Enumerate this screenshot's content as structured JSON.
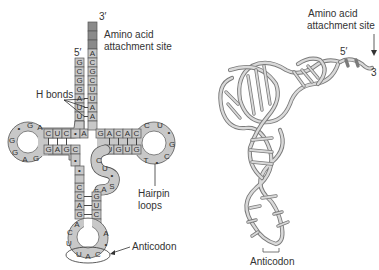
{
  "figure": {
    "left_panel": {
      "title": "tRNA cloverleaf (2D) structure",
      "labels": {
        "three_prime": "3′",
        "five_prime": "5′",
        "amino_acid_site_line1": "Amino acid",
        "amino_acid_site_line2": "attachment site",
        "h_bonds": "H bonds",
        "hairpin_line1": "Hairpin",
        "hairpin_line2": "loops",
        "anticodon": "Anticodon"
      },
      "acceptor_stem": {
        "unlabeled_3prime_cells": 3,
        "right_strand": [
          "A",
          "C",
          "G",
          "C",
          "U",
          "U",
          "A",
          "A"
        ],
        "left_strand": [
          "G",
          "C",
          "G",
          "G",
          "A",
          "U",
          "U"
        ]
      },
      "d_arm": {
        "top_strand": [
          "C",
          "U",
          "C",
          "A"
        ],
        "bottom_strand": [
          "G",
          "A",
          "G",
          "C"
        ],
        "loop": [
          "A",
          "G",
          "•",
          "G",
          "G",
          "A",
          "G"
        ]
      },
      "t_arm": {
        "top_strand": [
          "G",
          "A",
          "C",
          "A",
          "C"
        ],
        "bottom_strand": [
          "U",
          "G",
          "U",
          "G"
        ],
        "loop": [
          "C",
          "U",
          "•",
          "G",
          "C",
          "•",
          "T"
        ]
      },
      "variable_loop": [
        "C",
        "U",
        "•",
        "G",
        "A",
        "G",
        "S"
      ],
      "anticodon_arm": {
        "left_strand": [
          "•",
          "C",
          "C",
          "A",
          "G",
          "A"
        ],
        "right_strand": [
          "G",
          "U",
          "C",
          "•",
          "A"
        ],
        "loop": [
          "C",
          "U",
          "U",
          "A",
          "C",
          "•"
        ],
        "anticodon": [
          "U",
          "A",
          "C"
        ]
      },
      "colors": {
        "cell_fill": "#c8c8c8",
        "terminal_fill": "#8a8a8a",
        "outline": "#555555",
        "text": "#333333"
      }
    },
    "right_panel": {
      "title": "tRNA 3D folded structure",
      "labels": {
        "amino_acid_site_line1": "Amino acid",
        "amino_acid_site_line2": "attachment site",
        "five_prime": "5′",
        "three_prime": "3",
        "anticodon": "Anticodon"
      },
      "colors": {
        "ribbon_outline": "#7a7a7a",
        "ribbon_fill": "#d9d9d9"
      }
    }
  }
}
